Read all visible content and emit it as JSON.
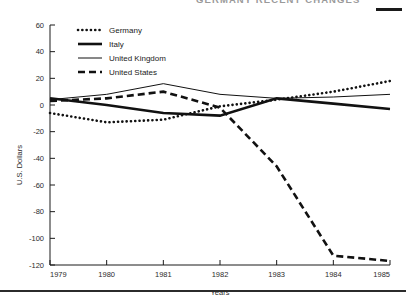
{
  "figure": {
    "cut_off_title": "GERMANY  RECENT  CHANGES",
    "top_rule": "rule-mark",
    "bottom_rule": "rule-mark"
  },
  "chart_data": {
    "type": "line",
    "title": "",
    "xlabel": "Years",
    "ylabel": "U.S. Dollars",
    "x": [
      1979,
      1980,
      1981,
      1982,
      1983,
      1984,
      1985
    ],
    "categories": [
      "1979",
      "1980",
      "1981",
      "1982",
      "1983",
      "1984",
      "1985"
    ],
    "xlim": [
      1979,
      1985
    ],
    "ylim": [
      -120,
      60
    ],
    "yticks": [
      60,
      40,
      20,
      0,
      -20,
      -40,
      -60,
      -80,
      -100,
      -120
    ],
    "ytick_labels": [
      "60",
      "40",
      "20",
      "0",
      "-20",
      "-40",
      "-60",
      "-80",
      "-100",
      "-120"
    ],
    "xticks": [
      1979,
      1980,
      1981,
      1982,
      1983,
      1984,
      1985
    ],
    "xtick_labels": [
      "1979",
      "1980",
      "1981",
      "1982",
      "1983",
      "1984",
      "1985"
    ],
    "grid": false,
    "legend_position": "upper-left-inside",
    "series": [
      {
        "name": "Germany",
        "style": "dotted",
        "values": [
          -6,
          -13,
          -11,
          -1,
          4,
          10,
          18
        ]
      },
      {
        "name": "Italy",
        "style": "solid-thick",
        "values": [
          5,
          0,
          -6,
          -8,
          5,
          1,
          -3
        ]
      },
      {
        "name": "United Kingdom",
        "style": "solid-thin",
        "values": [
          4,
          8,
          16,
          8,
          5,
          6,
          8
        ]
      },
      {
        "name": "United States",
        "style": "dashed",
        "values": [
          3,
          5,
          10,
          -2,
          -46,
          -113,
          -117
        ]
      }
    ]
  },
  "legend": {
    "items": [
      {
        "label": "Germany",
        "style": "dotted"
      },
      {
        "label": "Italy",
        "style": "solid-thick"
      },
      {
        "label": "United Kingdom",
        "style": "solid-thin"
      },
      {
        "label": "United States",
        "style": "dashed"
      }
    ]
  }
}
